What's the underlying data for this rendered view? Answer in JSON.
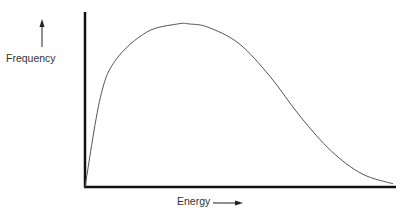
{
  "chart_data": {
    "type": "line",
    "title": "",
    "xlabel": "Energy",
    "ylabel": "Frequency",
    "axis_arrows": {
      "x": "right",
      "y": "up"
    },
    "grid": false,
    "legend": null,
    "ticks": {
      "x": [],
      "y": []
    },
    "x": [
      0,
      0.05,
      0.1,
      0.2,
      0.3,
      0.34,
      0.4,
      0.5,
      0.6,
      0.7,
      0.8,
      0.9,
      1.0
    ],
    "values": [
      0,
      0.55,
      0.78,
      0.95,
      1.0,
      1.0,
      0.98,
      0.88,
      0.68,
      0.43,
      0.22,
      0.08,
      0.02
    ],
    "xlim": [
      0,
      1
    ],
    "ylim": [
      0,
      1.07
    ],
    "line_color": "#555555",
    "axis_color": "#111111"
  }
}
